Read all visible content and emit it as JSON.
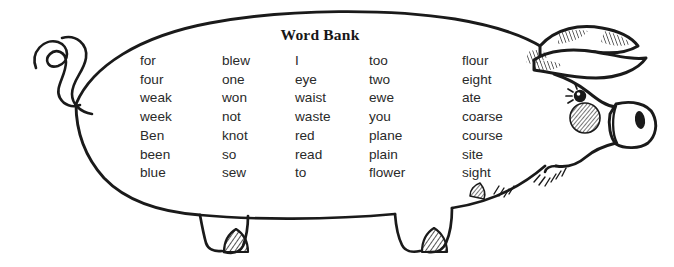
{
  "worksheet": {
    "title": "Word Bank",
    "subject": "homophones word bank on pig illustration",
    "background_color": "#ffffff",
    "ink_color": "#1a1a1a"
  },
  "word_bank": {
    "heading": "Word Bank",
    "columns": [
      {
        "id": "column-1",
        "words": [
          "for",
          "four",
          "weak",
          "week",
          "Ben",
          "been",
          "blue"
        ]
      },
      {
        "id": "column-2",
        "words": [
          "blew",
          "one",
          "won",
          "not",
          "knot",
          "so",
          "sew"
        ]
      },
      {
        "id": "column-3",
        "words": [
          "I",
          "eye",
          "waist",
          "waste",
          "red",
          "read",
          "to"
        ]
      },
      {
        "id": "column-4",
        "words": [
          "too",
          "two",
          "ewe",
          "you",
          "plane",
          "plain",
          "flower"
        ]
      },
      {
        "id": "column-5",
        "words": [
          "flour",
          "eight",
          "ate",
          "coarse",
          "course",
          "site",
          "sight"
        ]
      }
    ]
  },
  "illustration": {
    "name": "pig",
    "parts": [
      "curly-tail",
      "body-outline",
      "rear-leg",
      "front-leg",
      "front-hoof",
      "rear-hoof",
      "head",
      "upper-ear",
      "lower-ear",
      "eye",
      "eyelashes",
      "snout",
      "nostril",
      "cheek-blush",
      "chin",
      "chest-hatching"
    ]
  }
}
